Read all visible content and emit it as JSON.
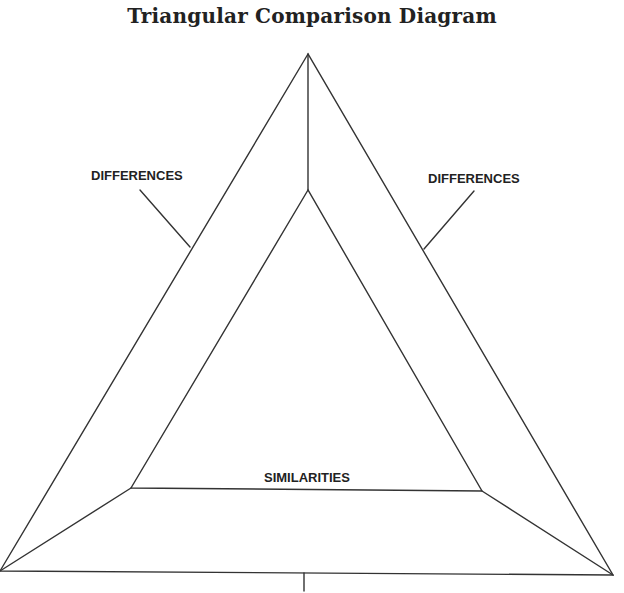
{
  "title": "Triangular Comparison Diagram",
  "labels": {
    "differences_left": "DIFFERENCES",
    "differences_right": "DIFFERENCES",
    "similarities": "SIMILARITIES"
  },
  "colors": {
    "line": "#333333",
    "text": "#222222",
    "background": "#ffffff"
  }
}
